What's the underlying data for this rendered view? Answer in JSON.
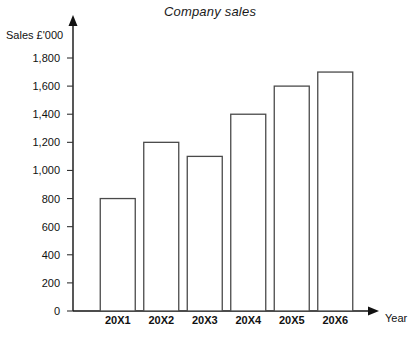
{
  "chart_data": {
    "type": "bar",
    "title": "Company sales",
    "xlabel": "Year",
    "ylabel": "Sales £'000",
    "categories": [
      "20X1",
      "20X2",
      "20X3",
      "20X4",
      "20X5",
      "20X6"
    ],
    "values": [
      800,
      1200,
      1100,
      1400,
      1600,
      1700
    ],
    "ylim": [
      0,
      1900
    ],
    "y_ticks": [
      0,
      200,
      400,
      600,
      800,
      1000,
      1200,
      1400,
      1600,
      1800
    ],
    "y_tick_labels": [
      "0",
      "200",
      "400",
      "600",
      "800",
      "1,000",
      "1,200",
      "1,400",
      "1,600",
      "1,800"
    ],
    "grid": false,
    "legend": null,
    "bar_fill": "#ffffff",
    "bar_stroke": "#4a4a4a",
    "axis_color": "#111111",
    "background": "#ffffff"
  }
}
